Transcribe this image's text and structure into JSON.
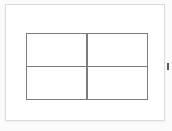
{
  "page": {
    "background_color": "#fbfbfb",
    "width": 172,
    "height": 131
  },
  "panel": {
    "name": "content-panel",
    "background_color": "#ffffff",
    "border_color": "#dcdcdc"
  },
  "figure": {
    "type": "grid",
    "rows": 2,
    "columns": 2,
    "line_color": "#7d7d7d",
    "line_width_px": 1.5,
    "fill_color": "#ffffff",
    "cells": [
      {
        "label": "",
        "row": 1,
        "column": 1
      },
      {
        "label": "",
        "row": 1,
        "column": 2
      },
      {
        "label": "",
        "row": 2,
        "column": 1
      },
      {
        "label": "",
        "row": 2,
        "column": 2
      }
    ]
  },
  "edge_marker": {
    "label": "",
    "color": "#5a5a5a"
  }
}
